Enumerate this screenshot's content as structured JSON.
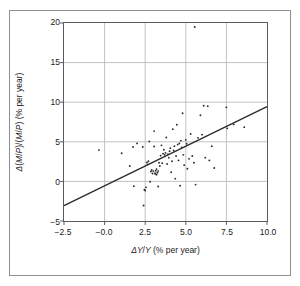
{
  "chart_data": {
    "type": "scatter",
    "title": "",
    "xlabel": "ΔY/Y (% per year)",
    "ylabel": "Δ(M/P)/(M/P) (% per year)",
    "xlim": [
      -2.5,
      10.0
    ],
    "ylim": [
      -5,
      20
    ],
    "xticks": [
      -2.5,
      -0.0,
      2.5,
      5.0,
      7.5,
      10.0
    ],
    "xtick_labels": [
      "−2.5",
      "−0.0",
      "2.5",
      "5.0",
      "7.5",
      "10.0"
    ],
    "yticks": [
      -5,
      0,
      5,
      10,
      15,
      20
    ],
    "ytick_labels": [
      "−5",
      "0",
      "5",
      "10",
      "15",
      "20"
    ],
    "grid": true,
    "legend": null,
    "marker_color": "#2b2b2b",
    "line_color": "#2b2b2b",
    "grid_color": "#b9b9bd",
    "frame_color": "#5a5a60",
    "trend_line": {
      "label": "regression line",
      "x": [
        -2.5,
        10.0
      ],
      "y": [
        -3.05,
        9.45
      ]
    },
    "points": [
      [
        -0.35,
        3.95
      ],
      [
        1.05,
        3.55
      ],
      [
        1.55,
        1.95
      ],
      [
        1.75,
        4.35
      ],
      [
        1.8,
        -0.6
      ],
      [
        2.0,
        4.8
      ],
      [
        2.35,
        4.35
      ],
      [
        2.4,
        -3.05
      ],
      [
        2.45,
        -1.05
      ],
      [
        2.5,
        -1.15
      ],
      [
        2.55,
        -0.75
      ],
      [
        2.6,
        2.4
      ],
      [
        2.65,
        2.15
      ],
      [
        2.7,
        2.55
      ],
      [
        2.75,
        5.05
      ],
      [
        2.8,
        -0.05
      ],
      [
        2.85,
        1.25
      ],
      [
        2.9,
        1.45
      ],
      [
        2.95,
        1.0
      ],
      [
        3.0,
        1.3
      ],
      [
        3.05,
        6.35
      ],
      [
        3.05,
        4.4
      ],
      [
        3.1,
        1.05
      ],
      [
        3.12,
        0.95
      ],
      [
        3.15,
        1.35
      ],
      [
        3.2,
        1.55
      ],
      [
        3.2,
        0.85
      ],
      [
        3.25,
        1.1
      ],
      [
        3.3,
        1.3
      ],
      [
        3.3,
        -0.65
      ],
      [
        3.35,
        2.35
      ],
      [
        3.4,
        1.95
      ],
      [
        3.45,
        3.25
      ],
      [
        3.5,
        4.55
      ],
      [
        3.55,
        2.3
      ],
      [
        3.6,
        3.5
      ],
      [
        3.65,
        4.0
      ],
      [
        3.7,
        3.35
      ],
      [
        3.75,
        3.6
      ],
      [
        3.8,
        5.55
      ],
      [
        3.85,
        2.2
      ],
      [
        3.9,
        3.45
      ],
      [
        3.95,
        3.0
      ],
      [
        4.0,
        3.8
      ],
      [
        4.05,
        4.2
      ],
      [
        4.1,
        1.15
      ],
      [
        4.15,
        2.55
      ],
      [
        4.2,
        6.6
      ],
      [
        4.25,
        3.9
      ],
      [
        4.3,
        4.45
      ],
      [
        4.35,
        0.35
      ],
      [
        4.4,
        3.2
      ],
      [
        4.45,
        7.15
      ],
      [
        4.5,
        4.65
      ],
      [
        4.55,
        2.65
      ],
      [
        4.6,
        4.8
      ],
      [
        4.65,
        -0.55
      ],
      [
        4.7,
        5.15
      ],
      [
        4.75,
        4.3
      ],
      [
        4.8,
        8.6
      ],
      [
        4.85,
        3.35
      ],
      [
        4.9,
        2.05
      ],
      [
        5.0,
        5.25
      ],
      [
        5.05,
        4.75
      ],
      [
        5.1,
        1.6
      ],
      [
        5.2,
        2.85
      ],
      [
        5.3,
        6.0
      ],
      [
        5.4,
        3.2
      ],
      [
        5.5,
        2.35
      ],
      [
        5.55,
        19.5
      ],
      [
        5.6,
        -0.4
      ],
      [
        5.75,
        5.5
      ],
      [
        5.9,
        8.35
      ],
      [
        6.0,
        5.9
      ],
      [
        6.1,
        9.55
      ],
      [
        6.2,
        3.0
      ],
      [
        6.35,
        9.5
      ],
      [
        6.45,
        2.65
      ],
      [
        6.6,
        4.45
      ],
      [
        6.75,
        1.7
      ],
      [
        7.5,
        9.35
      ],
      [
        7.55,
        6.7
      ],
      [
        7.95,
        7.2
      ],
      [
        8.6,
        6.85
      ]
    ]
  }
}
